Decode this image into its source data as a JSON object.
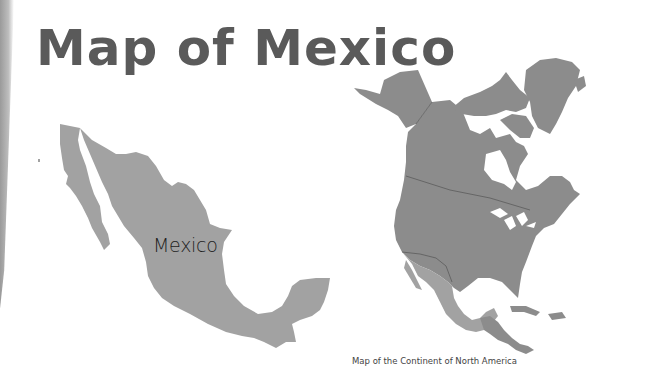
{
  "page": {
    "title": "Map of Mexico"
  },
  "mexico_map": {
    "label": "Mexico",
    "fill_color": "#a2a2a2"
  },
  "north_america_map": {
    "caption": "Map of the Continent of North America",
    "land_color": "#8c8c8c",
    "highlight_color": "#a2a2a2",
    "highlight_region": "Mexico"
  }
}
